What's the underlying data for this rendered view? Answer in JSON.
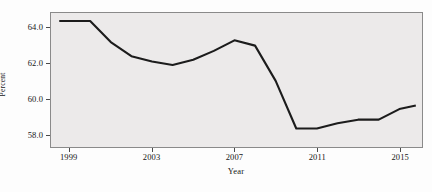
{
  "chart_data": {
    "type": "line",
    "title": "",
    "xlabel": "Year",
    "ylabel": "Percent",
    "xlim": [
      1998.1,
      2016.1
    ],
    "ylim": [
      57.25,
      64.85
    ],
    "grid": false,
    "legend": "none",
    "line_color": "#1c1c1c",
    "plot_background": "#eceaea",
    "xticks": [
      1999,
      2003,
      2007,
      2011,
      2015
    ],
    "xtick_labels": [
      "1999",
      "2003",
      "2007",
      "2011",
      "2015"
    ],
    "yticks": [
      58.0,
      60.0,
      62.0,
      64.0
    ],
    "ytick_labels": [
      "58.0",
      "60.0",
      "62.0",
      "64.0"
    ],
    "x": [
      1998.5,
      1999,
      2000,
      2001,
      2002,
      2003,
      2004,
      2005,
      2006,
      2007,
      2008,
      2009,
      2010,
      2011,
      2012,
      2013,
      2014,
      2015,
      2015.8
    ],
    "values": [
      64.4,
      64.4,
      64.4,
      63.2,
      62.4,
      62.1,
      61.9,
      62.2,
      62.7,
      63.3,
      63.0,
      61.0,
      58.3,
      58.3,
      58.6,
      58.8,
      58.8,
      59.4,
      59.6
    ],
    "series": [
      {
        "name": "Percent",
        "values": [
          64.4,
          64.4,
          64.4,
          63.2,
          62.4,
          62.1,
          61.9,
          62.2,
          62.7,
          63.3,
          63.0,
          61.0,
          58.3,
          58.3,
          58.6,
          58.8,
          58.8,
          59.4,
          59.6
        ]
      }
    ]
  }
}
